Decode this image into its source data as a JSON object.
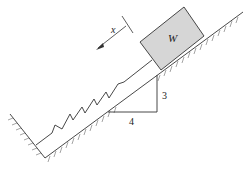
{
  "diagram": {
    "type": "mechanics-free-body",
    "labels": {
      "block": "W",
      "displacement": "x",
      "slope_rise": "3",
      "slope_run": "4"
    },
    "colors": {
      "block_fill": "#d6d6d6",
      "line": "#333333",
      "hatch": "#555555"
    }
  }
}
